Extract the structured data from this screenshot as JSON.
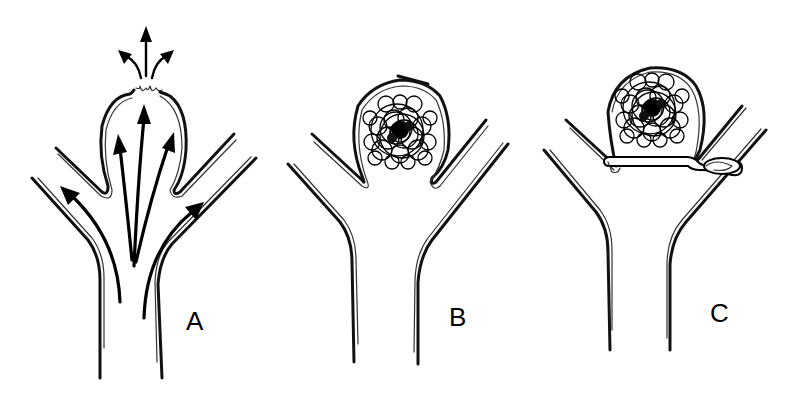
{
  "figure": {
    "panels": [
      {
        "id": "A",
        "label": "A",
        "description": "Aneurysm with blood flow arrows and rupture at dome"
      },
      {
        "id": "B",
        "label": "B",
        "description": "Aneurysm filled with embolization coils"
      },
      {
        "id": "C",
        "label": "C",
        "description": "Coiled aneurysm with surgical clip across neck"
      }
    ],
    "colors": {
      "line": "#000000",
      "background": "#ffffff"
    }
  }
}
